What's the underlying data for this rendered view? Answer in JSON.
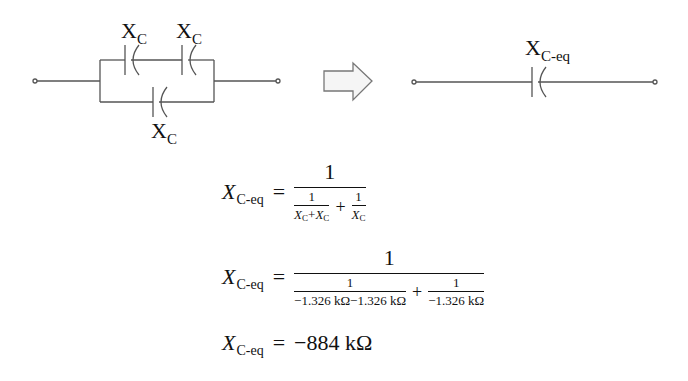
{
  "diagram": {
    "left_circuit": {
      "description": "Two capacitors in series, in parallel with a third capacitor",
      "labels": {
        "top_left_cap": {
          "main": "X",
          "sub": "C"
        },
        "top_right_cap": {
          "main": "X",
          "sub": "C"
        },
        "bottom_cap": {
          "main": "X",
          "sub": "C"
        }
      }
    },
    "arrow": "block-arrow-right",
    "right_circuit": {
      "description": "Single equivalent capacitor",
      "label": {
        "main": "X",
        "sub": "C-eq"
      }
    },
    "colors": {
      "wire": "#555555",
      "text": "#111111",
      "arrow_fill": "#f5f5f5",
      "arrow_stroke": "#777777"
    }
  },
  "equations": [
    {
      "lhs": {
        "var": "X",
        "sub": "C-eq"
      },
      "equals": "=",
      "numerator": "1",
      "terms": [
        {
          "num": "1",
          "den": "X_C+X_C",
          "den_parts": [
            "X",
            "C",
            "+",
            "X",
            "C"
          ]
        },
        {
          "num": "1",
          "den": "X_C",
          "den_parts": [
            "X",
            "C"
          ]
        }
      ],
      "plus": "+"
    },
    {
      "lhs": {
        "var": "X",
        "sub": "C-eq"
      },
      "equals": "=",
      "numerator": "1",
      "terms": [
        {
          "num": "1",
          "den": "−1.326 kΩ−1.326 kΩ"
        },
        {
          "num": "1",
          "den": "−1.326 kΩ"
        }
      ],
      "plus": "+"
    },
    {
      "lhs": {
        "var": "X",
        "sub": "C-eq"
      },
      "equals": "=",
      "result": "−884 kΩ"
    }
  ]
}
